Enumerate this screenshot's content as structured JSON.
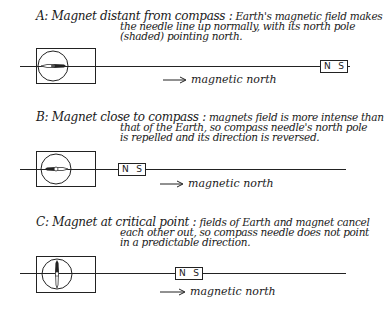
{
  "panels": [
    {
      "id": "A",
      "lead": "A: Magnet distant from compass :",
      "line1_rest": " Earth's magnetic field makes",
      "line2": "the needle line up normally, with its north pole",
      "line3": "(shaded) pointing north.",
      "needle_orientation": "north-pole-right",
      "magnet": {
        "n": "N",
        "s": "S"
      },
      "arrow_label": "magnetic north"
    },
    {
      "id": "B",
      "lead": "B: Magnet close to compass :",
      "line1_rest": " magnets field is more intense than",
      "line2": "that of the Earth, so compass needle's north pole",
      "line3": "is repelled and its direction is reversed.",
      "needle_orientation": "north-pole-left",
      "magnet": {
        "n": "N",
        "s": "S"
      },
      "arrow_label": "magnetic north"
    },
    {
      "id": "C",
      "lead": "C: Magnet at critical point :",
      "line1_rest": " fields of Earth and magnet cancel",
      "line2": "each other out, so compass needle does not point",
      "line3": "in a predictable direction.",
      "needle_orientation": "north-pole-up",
      "magnet": {
        "n": "N",
        "s": "S"
      },
      "arrow_label": "magnetic north"
    }
  ],
  "colors": {
    "ink": "#1a1a1a",
    "background": "#ffffff"
  }
}
